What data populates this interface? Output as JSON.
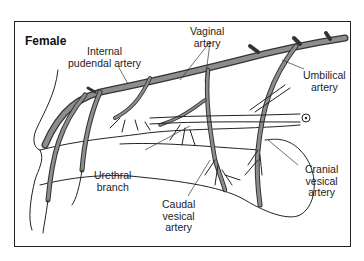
{
  "figure": {
    "title": "Female",
    "labels": {
      "internal_pudendal": [
        "Internal",
        "pudendal artery"
      ],
      "vaginal": [
        "Vaginal",
        "artery"
      ],
      "umbilical": [
        "Umbilical",
        "artery"
      ],
      "urethral": [
        "Urethral",
        "branch"
      ],
      "caudal_vesical": [
        "Caudal",
        "vesical",
        "artery"
      ],
      "cranial_vesical": [
        "Cranial",
        "vesical",
        "artery"
      ]
    },
    "colors": {
      "artery_fill": "#8d8d8d",
      "outline": "#333333",
      "background": "#ffffff"
    }
  }
}
